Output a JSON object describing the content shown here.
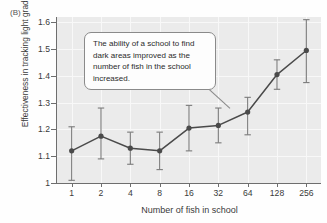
{
  "panel": {
    "label": "(B)"
  },
  "annotation": {
    "text": "The ability of a school to find dark areas improved as the number of fish in the school increased."
  },
  "chart_data": {
    "type": "line",
    "title": "",
    "xlabel": "Number of fish in school",
    "ylabel": "Effectiveness in tracking light gradient",
    "categories": [
      "1",
      "2",
      "4",
      "8",
      "16",
      "32",
      "64",
      "128",
      "256"
    ],
    "values": [
      1.12,
      1.175,
      1.13,
      1.12,
      1.205,
      1.215,
      1.265,
      1.405,
      1.495
    ],
    "error_low": [
      1.01,
      1.09,
      1.07,
      1.05,
      1.12,
      1.15,
      1.18,
      1.35,
      1.375
    ],
    "error_high": [
      1.21,
      1.28,
      1.19,
      1.19,
      1.29,
      1.28,
      1.32,
      1.46,
      1.61
    ],
    "ylim": [
      1.0,
      1.62
    ],
    "yticks": [
      "1",
      "1.1",
      "1.2",
      "1.3",
      "1.4",
      "1.5",
      "1.6"
    ],
    "ytick_values": [
      1.0,
      1.1,
      1.2,
      1.3,
      1.4,
      1.5,
      1.6
    ],
    "grid": true,
    "legend": "none",
    "marker_color": "#4a4a4a",
    "line_color": "#4a4a4a",
    "plot_background": "#ebebeb",
    "gridline_color": "#f8f8f8"
  }
}
